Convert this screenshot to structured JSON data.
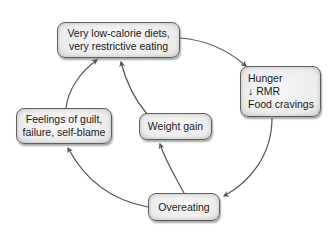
{
  "diagram": {
    "type": "cycle",
    "nodes": [
      {
        "id": "diet",
        "label": "Very low-calorie diets,\nvery restrictive eating"
      },
      {
        "id": "hunger",
        "label": "Hunger\n↓ RMR\nFood cravings"
      },
      {
        "id": "overeating",
        "label": "Overeating"
      },
      {
        "id": "weight",
        "label": "Weight gain"
      },
      {
        "id": "guilt",
        "label": "Feelings of guilt,\nfailure, self-blame"
      }
    ],
    "edges": [
      {
        "from": "diet",
        "to": "hunger"
      },
      {
        "from": "hunger",
        "to": "overeating"
      },
      {
        "from": "overeating",
        "to": "guilt"
      },
      {
        "from": "overeating",
        "to": "weight"
      },
      {
        "from": "guilt",
        "to": "diet"
      },
      {
        "from": "weight",
        "to": "diet"
      }
    ],
    "colors": {
      "arrow": "#555555",
      "border": "#5e5e5e",
      "fill": "#ececec",
      "text": "#1a1a1a"
    }
  }
}
